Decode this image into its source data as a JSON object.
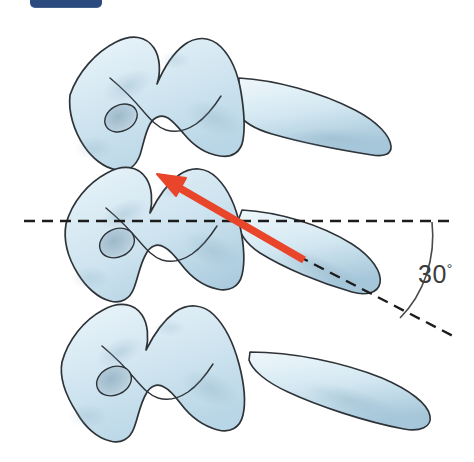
{
  "figure": {
    "title_badge": "",
    "annotations": {
      "angle_value": "30",
      "angle_unit": "°",
      "angle_full": "30°"
    },
    "colors": {
      "bone_fill_light": "#e3f0f7",
      "bone_fill_mid": "#c7dfec",
      "bone_shadow": "#8fb3c9",
      "bone_outline": "#2e3338",
      "arrow_red": "#e8452a",
      "dashed_line": "#1c1c1c",
      "badge_navy": "#2b4a7d",
      "label_gray": "#3b3b3b",
      "background": "#ffffff"
    },
    "elements": {
      "vertebra_count": 3,
      "vertebra_labels": [
        "upper-vertebra",
        "middle-vertebra",
        "lower-vertebra"
      ],
      "arrow_name": "needle-trajectory-arrow",
      "reference_line_name": "horizontal-reference-dashed-line",
      "trajectory_line_name": "oblique-trajectory-dashed-line",
      "arc_name": "angle-arc"
    },
    "geometry": {
      "horizontal_dash_y": 221,
      "horizontal_dash_x1": 24,
      "horizontal_dash_x2": 452,
      "arrow_tip_x": 157,
      "arrow_tip_y": 174,
      "arrow_tail_x": 302,
      "arrow_tail_y": 259,
      "oblique_end_x": 455,
      "oblique_end_y": 337,
      "arc_start_x": 434,
      "arc_start_y": 224,
      "arc_end_x": 399,
      "arc_end_y": 317
    }
  }
}
